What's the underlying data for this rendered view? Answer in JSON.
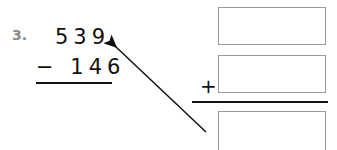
{
  "problem": {
    "number": "3.",
    "minuend": "539",
    "subtrahend_line": "− 146",
    "operator": "+",
    "answer_boxes": [
      {
        "label": "addend-1",
        "value": ""
      },
      {
        "label": "addend-2",
        "value": ""
      },
      {
        "label": "sum",
        "value": ""
      }
    ],
    "arrow": "points-to-minuend"
  }
}
